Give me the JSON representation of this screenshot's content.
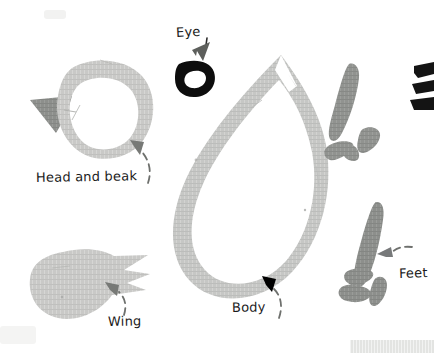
{
  "colors": {
    "background": "#ffffff",
    "paper_light": "#c9c9c7",
    "paper_dark": "#8d8f8c",
    "eye_black": "#0d0d0d",
    "ink": "#1b1b1b",
    "scrap_grey": "#e3e4e2"
  },
  "labels": {
    "eye": "Eye",
    "head_and_beak": "Head and beak",
    "wing": "Wing",
    "body": "Body",
    "feet": "Feet"
  },
  "shapes": {
    "head_ring": {
      "name": "head-ring",
      "description": "light grey paper ring forming the bird head"
    },
    "beak": {
      "name": "beak",
      "description": "dark grey triangular paper beak on left of head"
    },
    "eye": {
      "name": "eye",
      "description": "small black paper ring used as the eye"
    },
    "body": {
      "name": "body",
      "description": "large light grey teardrop paper outline forming the body"
    },
    "wing": {
      "name": "wing",
      "description": "light grey paper wing with jagged feather tips"
    },
    "foot_upper": {
      "name": "foot-upper",
      "description": "dark grey paper foot: long leg with three toes"
    },
    "foot_lower": {
      "name": "foot-lower",
      "description": "dark grey paper foot: long leg with three toes"
    },
    "paper_scrap": {
      "name": "paper-scrap",
      "description": "pale grey paper scrap at bottom right edge"
    },
    "cut_edge_fragment": {
      "name": "cut-edge-fragment",
      "description": "black cut-off shape at right edge of frame"
    }
  },
  "pointers": [
    {
      "name": "eye-pointer",
      "from": "Eye",
      "to": "eye"
    },
    {
      "name": "head-and-beak-pointer",
      "from": "Head and beak",
      "to": "head-ring"
    },
    {
      "name": "wing-pointer",
      "from": "Wing",
      "to": "wing"
    },
    {
      "name": "body-pointer",
      "from": "Body",
      "to": "body"
    },
    {
      "name": "feet-pointer",
      "from": "Feet",
      "to": "foot-lower"
    }
  ]
}
